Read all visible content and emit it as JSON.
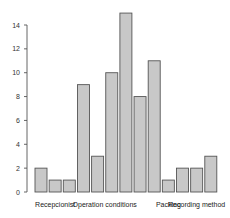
{
  "chart_data": {
    "type": "bar",
    "title": "",
    "xlabel": "",
    "ylabel": "",
    "ylim": [
      0,
      14
    ],
    "yticks": [
      0,
      2,
      4,
      6,
      8,
      10,
      12,
      14
    ],
    "grid": false,
    "legend": null,
    "values": [
      2,
      1,
      1,
      9,
      3,
      10,
      15,
      8,
      11,
      1,
      2,
      2,
      3
    ],
    "group_labels": [
      {
        "label": "Recepcionist",
        "bar_index": 1
      },
      {
        "label": "Operation conditions",
        "bar_index": 4.5
      },
      {
        "label": "Packing",
        "bar_index": 9
      },
      {
        "label": "Recording method",
        "bar_index": 11
      }
    ],
    "colors": {
      "bar_fill": "#c8c8c8",
      "bar_stroke": "#555555",
      "axis": "#555555"
    }
  }
}
